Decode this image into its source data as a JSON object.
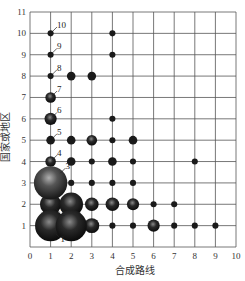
{
  "chart_data": {
    "type": "scatter",
    "subtype": "bubble",
    "title": "",
    "xlabel": "合成路线",
    "ylabel": "国家或地区",
    "xlim": [
      0,
      10
    ],
    "ylim": [
      0,
      11
    ],
    "xticks": [
      0,
      1,
      2,
      3,
      4,
      5,
      6,
      7,
      8,
      9,
      10
    ],
    "yticks": [
      1,
      2,
      3,
      4,
      5,
      6,
      7,
      8,
      9,
      10,
      11
    ],
    "grid": true,
    "legend": null,
    "points": [
      {
        "x": 1,
        "y": 10,
        "size": 1
      },
      {
        "x": 4,
        "y": 10,
        "size": 1
      },
      {
        "x": 1,
        "y": 9,
        "size": 1
      },
      {
        "x": 4,
        "y": 9,
        "size": 1
      },
      {
        "x": 1,
        "y": 8,
        "size": 1
      },
      {
        "x": 2,
        "y": 8,
        "size": 2
      },
      {
        "x": 3,
        "y": 8,
        "size": 2
      },
      {
        "x": 1,
        "y": 7,
        "size": 3
      },
      {
        "x": 1,
        "y": 6,
        "size": 4
      },
      {
        "x": 4,
        "y": 6,
        "size": 1
      },
      {
        "x": 1,
        "y": 5,
        "size": 2
      },
      {
        "x": 2,
        "y": 5,
        "size": 2
      },
      {
        "x": 3,
        "y": 5,
        "size": 3
      },
      {
        "x": 4,
        "y": 5,
        "size": 1
      },
      {
        "x": 5,
        "y": 5,
        "size": 2
      },
      {
        "x": 1,
        "y": 4,
        "size": 3
      },
      {
        "x": 2,
        "y": 4,
        "size": 2
      },
      {
        "x": 3,
        "y": 4,
        "size": 1
      },
      {
        "x": 4,
        "y": 4,
        "size": 2
      },
      {
        "x": 5,
        "y": 4,
        "size": 1
      },
      {
        "x": 8,
        "y": 4,
        "size": 1
      },
      {
        "x": 1,
        "y": 3,
        "size": 30
      },
      {
        "x": 2,
        "y": 3,
        "size": 1
      },
      {
        "x": 3,
        "y": 3,
        "size": 1
      },
      {
        "x": 4,
        "y": 3,
        "size": 1
      },
      {
        "x": 5,
        "y": 3,
        "size": 1
      },
      {
        "x": 1,
        "y": 2,
        "size": 12
      },
      {
        "x": 2,
        "y": 2,
        "size": 15
      },
      {
        "x": 3,
        "y": 2,
        "size": 5
      },
      {
        "x": 4,
        "y": 2,
        "size": 5
      },
      {
        "x": 5,
        "y": 2,
        "size": 4
      },
      {
        "x": 6,
        "y": 2,
        "size": 1
      },
      {
        "x": 7,
        "y": 2,
        "size": 1
      },
      {
        "x": 1,
        "y": 1,
        "size": 26
      },
      {
        "x": 2,
        "y": 1,
        "size": 26
      },
      {
        "x": 3,
        "y": 1,
        "size": 6
      },
      {
        "x": 4,
        "y": 1,
        "size": 1
      },
      {
        "x": 5,
        "y": 1,
        "size": 1
      },
      {
        "x": 6,
        "y": 1,
        "size": 4
      },
      {
        "x": 7,
        "y": 1,
        "size": 1
      },
      {
        "x": 8,
        "y": 1,
        "size": 1
      },
      {
        "x": 9,
        "y": 1,
        "size": 1
      }
    ],
    "annotations": [
      {
        "label": "1",
        "x": 1,
        "y": 1,
        "side": "below-right"
      },
      {
        "label": "2",
        "x": 1,
        "y": 2,
        "side": "below-right"
      },
      {
        "label": "3",
        "x": 1,
        "y": 3,
        "side": "above-right"
      },
      {
        "label": "4",
        "x": 1,
        "y": 4,
        "side": "above-right"
      },
      {
        "label": "5",
        "x": 1,
        "y": 5,
        "side": "above-right"
      },
      {
        "label": "6",
        "x": 1,
        "y": 6,
        "side": "above-right"
      },
      {
        "label": "7",
        "x": 1,
        "y": 7,
        "side": "above-right"
      },
      {
        "label": "8",
        "x": 1,
        "y": 8,
        "side": "above-right"
      },
      {
        "label": "9",
        "x": 1,
        "y": 9,
        "side": "above-right"
      },
      {
        "label": "10",
        "x": 1,
        "y": 10,
        "side": "above-right"
      }
    ]
  },
  "colors": {
    "grid": "#555555",
    "bubble": "#1a1a1a",
    "bubble_highlight": "#7a7a7a",
    "text": "#333333"
  }
}
